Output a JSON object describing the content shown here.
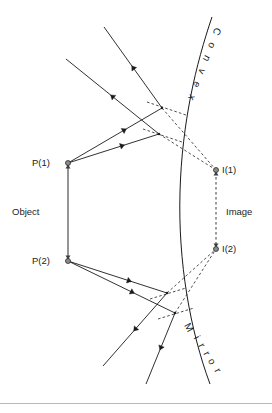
{
  "figure": {
    "background_color": "#ffffff",
    "ink_color": "#1a1a1a",
    "dash_color": "#3a3a3a",
    "dot_fill_color": "#8c8c8c",
    "footer_rule_color": "#b9b9b9"
  },
  "labels": {
    "object": "Object",
    "image": "Image",
    "point_1": "P(1)",
    "point_2": "P(2)",
    "image_1": "I(1)",
    "image_2": "I(2)",
    "convex": "Convex",
    "mirror": "Mirror"
  },
  "convex_letters": [
    {
      "ch": "C",
      "x": 214,
      "y": 30,
      "rot": 118
    },
    {
      "ch": "o",
      "x": 209,
      "y": 44,
      "rot": 118
    },
    {
      "ch": "n",
      "x": 204,
      "y": 57,
      "rot": 118
    },
    {
      "ch": "v",
      "x": 199,
      "y": 70,
      "rot": 118
    },
    {
      "ch": "e",
      "x": 194,
      "y": 83,
      "rot": 118
    },
    {
      "ch": "x",
      "x": 189,
      "y": 96,
      "rot": 118
    }
  ],
  "mirror_letters": [
    {
      "ch": "M",
      "x": 186,
      "y": 329,
      "rot": 62
    },
    {
      "ch": "i",
      "x": 194,
      "y": 339,
      "rot": 62
    },
    {
      "ch": "r",
      "x": 199,
      "y": 347,
      "rot": 62
    },
    {
      "ch": "r",
      "x": 204,
      "y": 355,
      "rot": 62
    },
    {
      "ch": "o",
      "x": 209,
      "y": 363,
      "rot": 62
    },
    {
      "ch": "r",
      "x": 215,
      "y": 372,
      "rot": 62
    }
  ],
  "geometry": {
    "mirror_curve": "M 212,17 C 196,64 182,122 180,192 C 178,262 190,330 210,384",
    "object_bar": {
      "x1": 68,
      "y1": 165,
      "x2": 68,
      "y2": 259
    },
    "image_bar": {
      "x1": 216,
      "y1": 172,
      "x2": 216,
      "y2": 252
    },
    "points": {
      "P1": {
        "x": 68,
        "y": 163,
        "label_x": 32,
        "label_y": 166
      },
      "P2": {
        "x": 68,
        "y": 261,
        "label_x": 32,
        "label_y": 264
      },
      "I1": {
        "x": 216,
        "y": 170,
        "label_x": 222,
        "label_y": 173
      },
      "I2": {
        "x": 216,
        "y": 249,
        "label_x": 222,
        "label_y": 252
      }
    },
    "reflect_upper": {
      "x": 162,
      "y": 108
    },
    "reflect_lower": {
      "x": 159,
      "y": 134
    },
    "reflect_lower_a": {
      "x": 167,
      "y": 293
    },
    "reflect_lower_b": {
      "x": 175,
      "y": 313
    },
    "side_labels": {
      "object_x": 12,
      "object_y": 215,
      "image_x": 226,
      "image_y": 215
    }
  },
  "rays": {
    "incident_from_P1": [
      {
        "x1": 68,
        "y1": 163,
        "x2": 162,
        "y2": 108,
        "arrow_t": 0.62
      },
      {
        "x1": 68,
        "y1": 163,
        "x2": 159,
        "y2": 134,
        "arrow_t": 0.62
      }
    ],
    "incident_from_P2": [
      {
        "x1": 68,
        "y1": 261,
        "x2": 175,
        "y2": 313,
        "arrow_t": 0.62
      },
      {
        "x1": 68,
        "y1": 261,
        "x2": 167,
        "y2": 293,
        "arrow_t": 0.64
      }
    ],
    "reflected_upper": [
      {
        "x1": 162,
        "y1": 108,
        "x2": 104,
        "y2": 27,
        "arrow_t": 0.52
      },
      {
        "x1": 159,
        "y1": 134,
        "x2": 66,
        "y2": 59,
        "arrow_t": 0.52
      }
    ],
    "reflected_lower": [
      {
        "x1": 167,
        "y1": 293,
        "x2": 103,
        "y2": 366,
        "arrow_t": 0.52
      },
      {
        "x1": 175,
        "y1": 313,
        "x2": 146,
        "y2": 384,
        "arrow_t": 0.52
      }
    ],
    "virtual_to_I1": [
      {
        "x1": 162,
        "y1": 108,
        "x2": 216,
        "y2": 170
      },
      {
        "x1": 159,
        "y1": 134,
        "x2": 216,
        "y2": 170
      }
    ],
    "virtual_to_I2": [
      {
        "x1": 167,
        "y1": 293,
        "x2": 216,
        "y2": 249
      },
      {
        "x1": 175,
        "y1": 313,
        "x2": 216,
        "y2": 249
      }
    ],
    "normals": [
      {
        "x1": 147,
        "y1": 102,
        "x2": 186,
        "y2": 115
      },
      {
        "x1": 143,
        "y1": 129,
        "x2": 182,
        "y2": 142
      },
      {
        "x1": 150,
        "y1": 299,
        "x2": 186,
        "y2": 288
      },
      {
        "x1": 158,
        "y1": 319,
        "x2": 194,
        "y2": 308
      }
    ]
  }
}
